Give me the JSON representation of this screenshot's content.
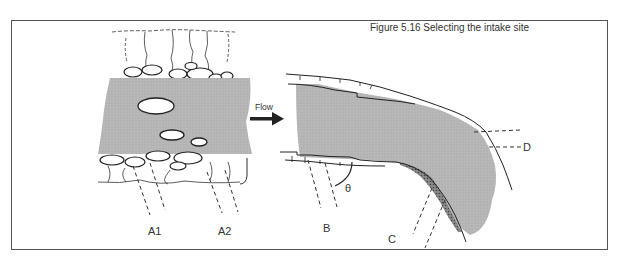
{
  "figure": {
    "caption": "Figure 5.16 Selecting the intake site",
    "flow_label": "Flow",
    "labels": {
      "a1": "A1",
      "a2": "A2",
      "b": "B",
      "c": "C",
      "d": "D",
      "theta": "θ"
    },
    "colors": {
      "water": "#b5b5b5",
      "line": "#222222",
      "frame": "#555555",
      "background": "#ffffff"
    }
  }
}
